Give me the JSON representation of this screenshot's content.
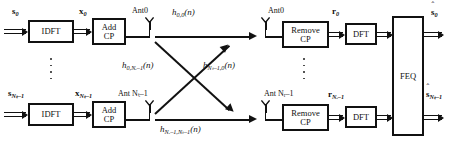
{
  "diagram": {
    "transmitters": [
      {
        "input_label": "s",
        "input_sub": "0",
        "idft_label": "IDFT",
        "addcp_line1": "Add",
        "addcp_line2": "CP",
        "signal_label": "x",
        "signal_sub": "0",
        "antenna_label": "Ant0"
      },
      {
        "input_label": "s",
        "input_sub": "Nₜ–1",
        "idft_label": "IDFT",
        "addcp_line1": "Add",
        "addcp_line2": "CP",
        "signal_label": "x",
        "signal_sub": "Nₜ–1",
        "antenna_label": "Ant Nₜ–1"
      }
    ],
    "receivers": [
      {
        "antenna_label": "Ant0",
        "removecp_line1": "Remove",
        "removecp_line2": "CP",
        "signal_label": "r",
        "signal_sub": "0",
        "dft_label": "DFT",
        "output_label": "s",
        "output_sub": "0",
        "output_hat": "ˆ"
      },
      {
        "antenna_label": "Ant Nᵣ–1",
        "removecp_line1": "Remove",
        "removecp_line2": "CP",
        "signal_label": "r",
        "signal_sub": "Nᵣ–1",
        "dft_label": "DFT",
        "output_label": "s",
        "output_sub": "Nₜ–1",
        "output_hat": "ˆ"
      }
    ],
    "equalizer": {
      "label": "FEQ"
    },
    "channels": [
      {
        "name": "h-0-0",
        "label": "h",
        "sub": "0,0",
        "arg": "(n)"
      },
      {
        "name": "h-0-Nr1",
        "label": "h",
        "sub": "0,Nᵣ–1",
        "arg": "(n)"
      },
      {
        "name": "h-Nt1-0",
        "label": "h",
        "sub": "Nₜ–1,0",
        "arg": "(n)"
      },
      {
        "name": "h-Nt1-Nr1",
        "label": "h",
        "sub": "Nᵣ–1,Nₜ–1",
        "arg": "(n)"
      }
    ],
    "ellipsis": "vertical-dots"
  }
}
